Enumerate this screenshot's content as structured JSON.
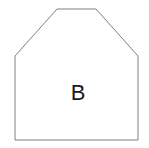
{
  "figure": {
    "kind": "geometric-shape-diagram",
    "background_color": "#ffffff",
    "width": 149,
    "height": 148,
    "shape": {
      "name": "pentagon-beveled-top",
      "label": "B",
      "fill_color": "#ffffff",
      "stroke_color": "#808080",
      "stroke_width": 1,
      "points": "15,140 15,56 57,9 96,9 138,56 138,140",
      "vertices": [
        {
          "x": 15,
          "y": 140
        },
        {
          "x": 15,
          "y": 56
        },
        {
          "x": 57,
          "y": 9
        },
        {
          "x": 96,
          "y": 9
        },
        {
          "x": 138,
          "y": 56
        },
        {
          "x": 138,
          "y": 140
        }
      ]
    },
    "label": {
      "text": "B",
      "x": 78,
      "y": 100,
      "color": "#1a1a1a",
      "font_size": 22
    }
  }
}
